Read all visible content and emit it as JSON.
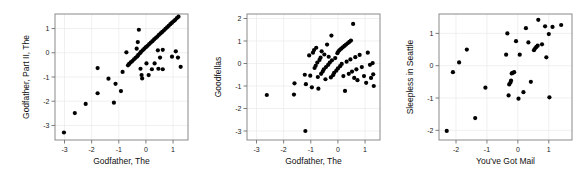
{
  "figure": {
    "title": "",
    "background": "#ffffff",
    "panel_count": 3,
    "point_color": "#000000",
    "frame_color": "#8a8a8a",
    "grid_color": "#e9e9e9"
  },
  "chart_data": [
    {
      "type": "scatter",
      "title": "",
      "xlabel": "Godfather, The",
      "ylabel": "Godfather, Part II, The",
      "xlim": [
        -3.35,
        1.55
      ],
      "ylim": [
        -3.6,
        1.6
      ],
      "xticks": [
        -3,
        -2,
        -1,
        0,
        1
      ],
      "yticks": [
        1,
        0,
        -1,
        -2,
        -3
      ],
      "xticklabels": [
        "-3",
        "-2",
        "-1",
        "0",
        "1"
      ],
      "yticklabels": [
        "1",
        "0",
        "-1",
        "-2",
        "-3"
      ],
      "grid": true,
      "legend": "none",
      "points": [
        [
          -3.02,
          -3.29
        ],
        [
          -2.62,
          -2.49
        ],
        [
          -2.22,
          -2.11
        ],
        [
          -1.78,
          -1.67
        ],
        [
          -1.78,
          -0.63
        ],
        [
          -1.38,
          -1.07
        ],
        [
          -1.18,
          -2.06
        ],
        [
          -1.12,
          -1.28
        ],
        [
          -0.92,
          -1.58
        ],
        [
          -0.86,
          -0.79
        ],
        [
          -0.72,
          0.02
        ],
        [
          -0.66,
          -0.52
        ],
        [
          -0.62,
          -0.46
        ],
        [
          -0.56,
          -0.4
        ],
        [
          -0.5,
          -0.34
        ],
        [
          -0.44,
          -0.27
        ],
        [
          -0.38,
          -0.21
        ],
        [
          -0.34,
          0.17
        ],
        [
          -0.32,
          -0.15
        ],
        [
          -0.3,
          0.44
        ],
        [
          -0.28,
          -0.09
        ],
        [
          -0.26,
          0.95
        ],
        [
          -0.22,
          -0.02
        ],
        [
          -0.2,
          -0.66
        ],
        [
          -0.18,
          0.04
        ],
        [
          -0.16,
          -0.92
        ],
        [
          -0.14,
          -1.06
        ],
        [
          -0.12,
          0.1
        ],
        [
          -0.06,
          0.17
        ],
        [
          0.0,
          0.23
        ],
        [
          0.02,
          -0.44
        ],
        [
          0.06,
          0.29
        ],
        [
          0.1,
          -0.92
        ],
        [
          0.12,
          0.36
        ],
        [
          0.18,
          0.42
        ],
        [
          0.22,
          -0.68
        ],
        [
          0.24,
          0.48
        ],
        [
          0.3,
          0.55
        ],
        [
          0.32,
          -0.44
        ],
        [
          0.36,
          0.61
        ],
        [
          0.42,
          0.67
        ],
        [
          0.44,
          0.1
        ],
        [
          0.46,
          -0.66
        ],
        [
          0.48,
          0.74
        ],
        [
          0.52,
          -0.2
        ],
        [
          0.54,
          0.8
        ],
        [
          0.6,
          0.86
        ],
        [
          0.62,
          -0.68
        ],
        [
          0.66,
          0.92
        ],
        [
          0.72,
          0.99
        ],
        [
          0.78,
          1.05
        ],
        [
          0.84,
          1.11
        ],
        [
          0.9,
          1.18
        ],
        [
          0.96,
          1.24
        ],
        [
          1.02,
          1.3
        ],
        [
          1.08,
          1.36
        ],
        [
          1.14,
          1.43
        ],
        [
          1.2,
          1.49
        ],
        [
          1.1,
          0.06
        ],
        [
          1.18,
          -0.2
        ],
        [
          1.28,
          -0.58
        ],
        [
          0.96,
          -0.16
        ],
        [
          0.62,
          0.12
        ]
      ]
    },
    {
      "type": "scatter",
      "title": "",
      "xlabel": "Godfather, The",
      "ylabel": "Goodfellas",
      "xlim": [
        -3.35,
        1.55
      ],
      "ylim": [
        -3.4,
        2.2
      ],
      "xticks": [
        -3,
        -2,
        -1,
        0,
        1
      ],
      "yticks": [
        2,
        1,
        0,
        -1,
        -2,
        -3
      ],
      "xticklabels": [
        "-3",
        "-2",
        "-1",
        "0",
        "1"
      ],
      "yticklabels": [
        "2",
        "1",
        "0",
        "-1",
        "-2",
        "-3"
      ],
      "grid": true,
      "legend": "none",
      "points": [
        [
          -2.62,
          -1.4
        ],
        [
          -1.62,
          -1.38
        ],
        [
          -1.6,
          -0.88
        ],
        [
          -1.2,
          -3.0
        ],
        [
          -1.22,
          -0.5
        ],
        [
          -1.06,
          0.36
        ],
        [
          -1.02,
          -0.54
        ],
        [
          -0.92,
          0.48
        ],
        [
          -0.88,
          0.6
        ],
        [
          -0.86,
          -0.2
        ],
        [
          -0.82,
          -0.1
        ],
        [
          -0.8,
          0.7
        ],
        [
          -0.76,
          0.04
        ],
        [
          -0.74,
          -0.6
        ],
        [
          -0.72,
          -1.12
        ],
        [
          -0.68,
          0.16
        ],
        [
          -0.64,
          0.26
        ],
        [
          -0.62,
          -0.46
        ],
        [
          -0.6,
          0.54
        ],
        [
          -0.56,
          -0.36
        ],
        [
          -0.52,
          -0.26
        ],
        [
          -0.5,
          0.4
        ],
        [
          -0.46,
          -0.7
        ],
        [
          -0.44,
          -0.16
        ],
        [
          -0.4,
          0.84
        ],
        [
          -0.36,
          -0.06
        ],
        [
          -0.34,
          0.3
        ],
        [
          -0.3,
          0.04
        ],
        [
          -0.26,
          -0.62
        ],
        [
          -0.24,
          1.24
        ],
        [
          -0.22,
          0.14
        ],
        [
          -0.18,
          -0.52
        ],
        [
          -0.14,
          -0.42
        ],
        [
          -0.1,
          0.24
        ],
        [
          -0.06,
          -0.32
        ],
        [
          -0.02,
          0.46
        ],
        [
          0.0,
          -0.22
        ],
        [
          0.02,
          0.54
        ],
        [
          0.06,
          0.6
        ],
        [
          0.08,
          -0.12
        ],
        [
          0.12,
          0.66
        ],
        [
          0.14,
          -0.02
        ],
        [
          0.18,
          0.72
        ],
        [
          0.2,
          -0.56
        ],
        [
          0.24,
          0.78
        ],
        [
          0.26,
          -1.22
        ],
        [
          0.3,
          0.84
        ],
        [
          0.32,
          0.08
        ],
        [
          0.36,
          0.9
        ],
        [
          0.4,
          -0.46
        ],
        [
          0.42,
          0.96
        ],
        [
          0.46,
          0.18
        ],
        [
          0.48,
          1.02
        ],
        [
          0.52,
          -0.36
        ],
        [
          0.56,
          1.76
        ],
        [
          0.6,
          -0.64
        ],
        [
          0.64,
          0.28
        ],
        [
          0.68,
          -0.26
        ],
        [
          0.72,
          -0.74
        ],
        [
          0.8,
          0.38
        ],
        [
          0.88,
          -0.16
        ],
        [
          0.96,
          -0.56
        ],
        [
          1.04,
          -0.86
        ],
        [
          1.1,
          0.48
        ],
        [
          1.18,
          -0.06
        ],
        [
          1.22,
          -0.64
        ],
        [
          1.28,
          0.02
        ],
        [
          1.3,
          -0.48
        ],
        [
          1.32,
          -1.0
        ],
        [
          -0.96,
          -1.06
        ],
        [
          -1.18,
          -0.92
        ]
      ]
    },
    {
      "type": "scatter",
      "title": "",
      "xlabel": "You've Got Mail",
      "ylabel": "Sleepless in Seattle",
      "xlim": [
        -2.55,
        1.75
      ],
      "ylim": [
        -2.3,
        1.6
      ],
      "xticks": [
        -2,
        -1,
        0,
        1
      ],
      "yticks": [
        1,
        0,
        -1,
        -2
      ],
      "xticklabels": [
        "-2",
        "-1",
        "0",
        "1"
      ],
      "yticklabels": [
        "1",
        "0",
        "-1",
        "-2"
      ],
      "grid": true,
      "legend": "none",
      "points": [
        [
          -2.3,
          -2.02
        ],
        [
          -2.1,
          -0.2
        ],
        [
          -1.9,
          0.1
        ],
        [
          -1.65,
          0.5
        ],
        [
          -1.38,
          -1.62
        ],
        [
          -1.05,
          -0.68
        ],
        [
          -0.38,
          0.34
        ],
        [
          -0.34,
          1.0
        ],
        [
          -0.3,
          -0.92
        ],
        [
          -0.28,
          -0.58
        ],
        [
          -0.24,
          -0.52
        ],
        [
          -0.22,
          -0.46
        ],
        [
          -0.2,
          -0.24
        ],
        [
          -0.16,
          -0.22
        ],
        [
          -0.12,
          -0.2
        ],
        [
          -0.06,
          0.76
        ],
        [
          0.02,
          -1.02
        ],
        [
          0.06,
          0.34
        ],
        [
          0.18,
          -0.82
        ],
        [
          0.26,
          1.16
        ],
        [
          0.34,
          0.72
        ],
        [
          0.42,
          -0.5
        ],
        [
          0.52,
          0.48
        ],
        [
          0.56,
          0.54
        ],
        [
          0.6,
          0.58
        ],
        [
          0.64,
          0.62
        ],
        [
          0.66,
          1.42
        ],
        [
          0.88,
          1.22
        ],
        [
          0.92,
          0.26
        ],
        [
          1.0,
          0.98
        ],
        [
          1.02,
          -0.98
        ],
        [
          1.12,
          1.2
        ],
        [
          1.4,
          1.26
        ],
        [
          0.78,
          0.66
        ]
      ]
    }
  ]
}
